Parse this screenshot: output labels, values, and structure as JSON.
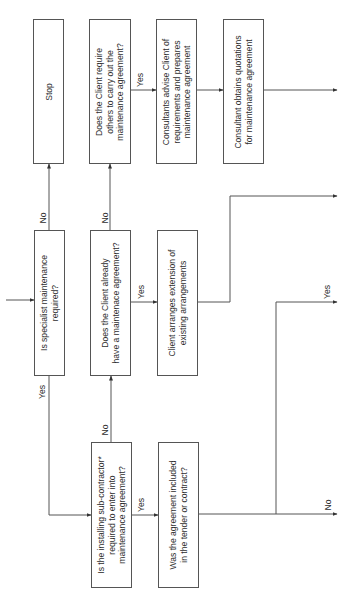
{
  "flowchart": {
    "nodes": {
      "specialist": "Is specialist maintenance\nrequired?",
      "stop": "Stop",
      "already_has": "Does the Client already\nhave a maintenace agreement?",
      "require_others": "Does the Client require\nothers to carry out the\nmaintenance agreement?",
      "installing_sub": "Is the installing sub-contractor*\nrequired to enter into\nmaintenance agreement?",
      "client_arranges": "Client arranges extension of\nexisting arrangements",
      "consultants_advise": "Consultants advise Client of\nrequirements and prepares\nmaintenance agreement",
      "consultant_obtains": "Consultant obtains quotations\nfor maintenance agreement",
      "agreement_included": "Was the agreement included\nin the tender or contract?"
    },
    "labels": {
      "specialist_no": "No",
      "specialist_yes": "Yes",
      "already_no": "No",
      "already_yes": "Yes",
      "require_yes": "Yes",
      "installing_no": "No",
      "installing_yes": "Yes",
      "included_yes": "Yes",
      "included_no": "No"
    },
    "colors": {
      "line": "#555555",
      "text": "#2e2e2e",
      "background": "#ffffff"
    }
  }
}
